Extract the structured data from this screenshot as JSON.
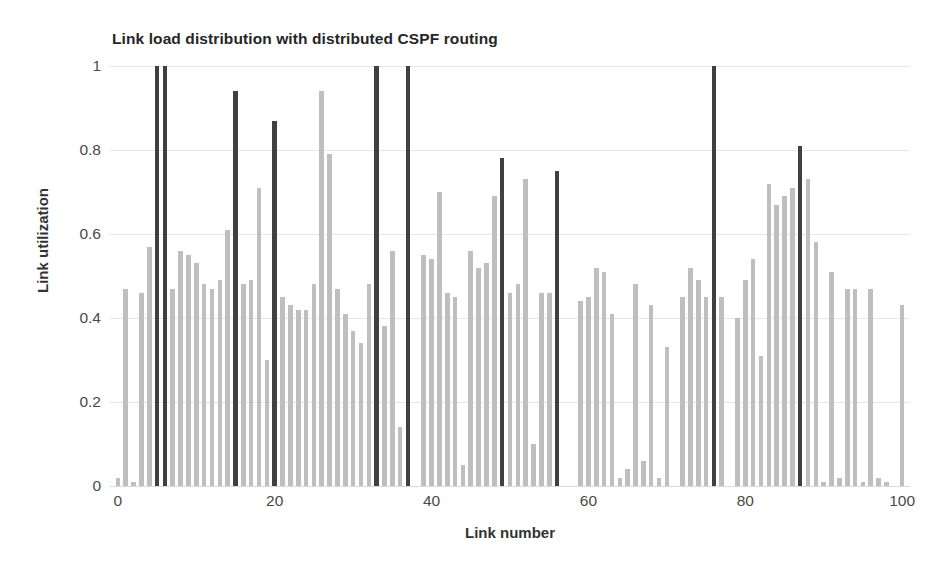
{
  "chart_data": {
    "type": "bar",
    "title": "Link load distribution with distributed CSPF routing",
    "xlabel": "Link number",
    "ylabel": "Link utilization",
    "xlim": [
      -1,
      101
    ],
    "ylim": [
      0,
      1
    ],
    "grid": true,
    "legend": null,
    "xticks": [
      0,
      20,
      40,
      60,
      80,
      100
    ],
    "yticks": [
      0,
      0.2,
      0.4,
      0.6,
      0.8,
      1
    ],
    "ytick_labels": [
      "0",
      "0.2",
      "0.4",
      "0.6",
      "0.8",
      "1"
    ],
    "xtick_labels": [
      "0",
      "20",
      "40",
      "60",
      "80",
      "100"
    ],
    "colors": {
      "normal_bar": "#bfbfbf",
      "highlight_bar": "#404040",
      "gridline": "#e6e6e6",
      "axis_text": "#4a4a4a",
      "title_text": "#262626",
      "background": "#ffffff"
    },
    "highlight_indices": [
      5,
      6,
      15,
      20,
      33,
      37,
      49,
      56,
      76,
      87
    ],
    "categories": [
      0,
      1,
      2,
      3,
      4,
      5,
      6,
      7,
      8,
      9,
      10,
      11,
      12,
      13,
      14,
      15,
      16,
      17,
      18,
      19,
      20,
      21,
      22,
      23,
      24,
      25,
      26,
      27,
      28,
      29,
      30,
      31,
      32,
      33,
      34,
      35,
      36,
      37,
      38,
      39,
      40,
      41,
      42,
      43,
      44,
      45,
      46,
      47,
      48,
      49,
      50,
      51,
      52,
      53,
      54,
      55,
      56,
      57,
      58,
      59,
      60,
      61,
      62,
      63,
      64,
      65,
      66,
      67,
      68,
      69,
      70,
      71,
      72,
      73,
      74,
      75,
      76,
      77,
      78,
      79,
      80,
      81,
      82,
      83,
      84,
      85,
      86,
      87,
      88,
      89,
      90,
      91,
      92,
      93,
      94,
      95,
      96,
      97,
      98,
      99,
      100
    ],
    "values": [
      0.02,
      0.47,
      0.01,
      0.46,
      0.57,
      1.0,
      1.0,
      0.47,
      0.56,
      0.55,
      0.53,
      0.48,
      0.47,
      0.49,
      0.61,
      0.94,
      0.48,
      0.49,
      0.71,
      0.3,
      0.87,
      0.45,
      0.43,
      0.42,
      0.42,
      0.48,
      0.94,
      0.79,
      0.47,
      0.41,
      0.37,
      0.34,
      0.48,
      1.0,
      0.38,
      0.56,
      0.14,
      1.0,
      0.0,
      0.55,
      0.54,
      0.7,
      0.46,
      0.45,
      0.05,
      0.56,
      0.52,
      0.53,
      0.69,
      0.78,
      0.46,
      0.48,
      0.73,
      0.1,
      0.46,
      0.46,
      0.75,
      0.0,
      0.0,
      0.44,
      0.45,
      0.52,
      0.51,
      0.41,
      0.02,
      0.04,
      0.48,
      0.06,
      0.43,
      0.02,
      0.33,
      0.0,
      0.45,
      0.52,
      0.49,
      0.45,
      1.0,
      0.45,
      0.0,
      0.4,
      0.49,
      0.54,
      0.31,
      0.72,
      0.67,
      0.69,
      0.71,
      0.81,
      0.73,
      0.58,
      0.01,
      0.51,
      0.02,
      0.47,
      0.47,
      0.01,
      0.47,
      0.02,
      0.01,
      0.0,
      0.43
    ]
  }
}
